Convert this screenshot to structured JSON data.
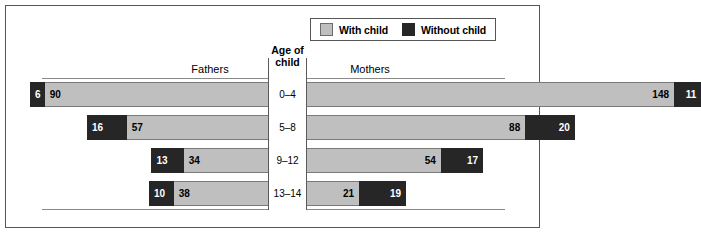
{
  "legend": {
    "entries": [
      {
        "label": "With child",
        "color": "#bfbfbf",
        "icon": "legend-swatch-with-child"
      },
      {
        "label": "Without child",
        "color": "#262626",
        "icon": "legend-swatch-without-child"
      }
    ]
  },
  "headers": {
    "center_line1": "Age of",
    "center_line2": "child",
    "left_panel": "Fathers",
    "right_panel": "Mothers"
  },
  "chart_data": {
    "type": "bar",
    "subtype": "diverging-stacked-bar",
    "title": "",
    "xlabel": "",
    "ylabel": "Age of child",
    "grid": false,
    "legend_position": "top-right",
    "categories": [
      "0–4",
      "5–8",
      "9–12",
      "13–14"
    ],
    "panels": [
      {
        "name": "Fathers",
        "direction": "left",
        "segment_order": [
          "Without child",
          "With child"
        ],
        "series": [
          {
            "name": "Without child",
            "values": [
              6,
              16,
              13,
              10
            ],
            "color": "#262626"
          },
          {
            "name": "With child",
            "values": [
              90,
              57,
              34,
              38
            ],
            "color": "#bfbfbf"
          }
        ],
        "totals": [
          96,
          73,
          47,
          48
        ]
      },
      {
        "name": "Mothers",
        "direction": "right",
        "segment_order": [
          "With child",
          "Without child"
        ],
        "series": [
          {
            "name": "With child",
            "values": [
              148,
              88,
              54,
              21
            ],
            "color": "#bfbfbf"
          },
          {
            "name": "Without child",
            "values": [
              11,
              20,
              17,
              19
            ],
            "color": "#262626"
          }
        ],
        "totals": [
          159,
          108,
          71,
          40
        ]
      }
    ]
  },
  "layout": {
    "axis_left_x": 268,
    "axis_right_x": 306,
    "row_top": [
      82,
      115,
      148,
      181
    ],
    "row_height": 25,
    "px_per_unit": 2.48
  }
}
